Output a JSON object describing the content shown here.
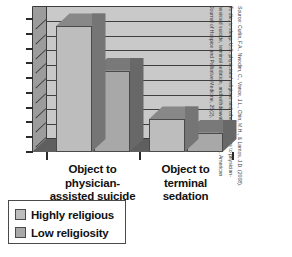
{
  "chart_data": {
    "type": "bar",
    "title": "",
    "subtitle": "",
    "xlabel": "",
    "ylabel": "",
    "ylim": [
      0,
      90
    ],
    "yticks": [
      0,
      10,
      20,
      30,
      40,
      50,
      60,
      70,
      80,
      90
    ],
    "grid": true,
    "legend_position": "bottom-left",
    "style": "3d-column",
    "categories": [
      "Object to physician-assisted suicide",
      "Object to terminal sedation"
    ],
    "series": [
      {
        "name": "Highly religious",
        "values": [
          85,
          22
        ],
        "color": "#bdbdbd"
      },
      {
        "name": "Low religiosity",
        "values": [
          55,
          13
        ],
        "color": "#a8a8a8"
      }
    ]
  },
  "axis": {
    "y_tick_labels": [
      "90",
      "80",
      "70",
      "60",
      "50",
      "40",
      "30",
      "20",
      "10",
      "0"
    ]
  },
  "categories": [
    {
      "line1": "Object to",
      "line2": "physician-",
      "line3": "assisted suicide"
    },
    {
      "line1": "Object to",
      "line2": "terminal",
      "line3": "sedation"
    }
  ],
  "legend": {
    "items": [
      {
        "label": "Highly religious",
        "color": "#bdbdbd"
      },
      {
        "label": "Low religiosity",
        "color": "#a8a8a8"
      }
    ]
  },
  "source_note": {
    "line1": "Source: Curlin, F.A., Nwodim, C., Vance, J.L., Chin, M.H., & Lantos, J.D. (2008).",
    "line2": "To die, to sleep: U.S. physicians' religious and other objections to physician-",
    "line3": "assisted suicide, terminal sedation, and withdrawal of life support. American",
    "line4": "Journal of Hospice and Palliative Medicine, 25(2), 112–120."
  },
  "colors": {
    "wall": "#c9c9c9",
    "wall_shade": "#9c9c9c",
    "floor": "#5f5f5f",
    "gridline": "#3f3f3f",
    "bar_light": "#bdbdbd",
    "bar_dark": "#a8a8a8",
    "bar_top_shade": "#8d8d8d",
    "outline": "#3a3a3a",
    "text": "#111111"
  }
}
